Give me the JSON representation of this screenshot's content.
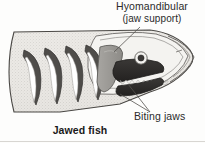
{
  "figure": {
    "caption": "Jawed fish",
    "labels": {
      "hyomandibular": "Hyomandibular",
      "hyomandibular_sub": "(jaw support)",
      "biting_jaws": "Biting jaws"
    },
    "colors": {
      "body_fill": "#e9e7e3",
      "body_stipple": "#b9b6b1",
      "outline": "#4a4845",
      "gill_arch_dark": "#4f4d4a",
      "gill_arch_light": "#ffffff",
      "jaw_dark": "#2e2c2b",
      "hyomandibular_grey": "#9b9995",
      "tooth_white": "#f7f6f3",
      "text": "#2b2b2b",
      "caption_text": "#1a1a1a",
      "leader_line": "#55534f",
      "page_background": "#fdfdfc"
    },
    "parts": [
      "body",
      "gill-arch-1",
      "gill-arch-2",
      "gill-arch-3",
      "gill-arch-4",
      "hyomandibular-bone",
      "upper-jaw",
      "lower-jaw",
      "teeth",
      "eye",
      "snout"
    ]
  }
}
